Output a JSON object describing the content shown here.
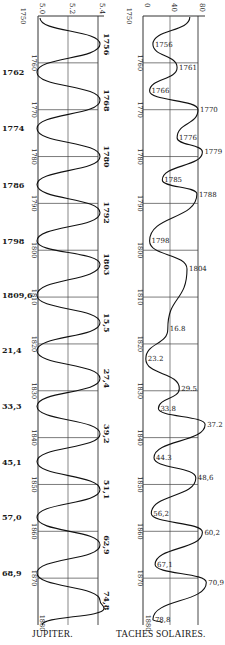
{
  "chart_data": [
    {
      "type": "line",
      "title": "JUPITER.",
      "orientation": "vertical-time",
      "xaxis": {
        "ticks": [
          "5.0",
          "5.2",
          "5.4"
        ],
        "range": [
          5.0,
          5.4
        ]
      },
      "yaxis": {
        "label": "year",
        "ticks": [
          "1750",
          "1760",
          "1770",
          "1780",
          "1790",
          "1800",
          "1810",
          "1820",
          "1830",
          "1840",
          "1850",
          "1860",
          "1870",
          "1880"
        ],
        "range": [
          1750,
          1880
        ]
      },
      "grid": true,
      "minima_labels": [
        "1762",
        "1774",
        "1786",
        "1798",
        "1809,6",
        "21,4",
        "33,3",
        "45,1",
        "57,0",
        "68,9"
      ],
      "minima_years": [
        1762,
        1774,
        1786,
        1798,
        1809.6,
        1821.4,
        1833.3,
        1845.1,
        1857.0,
        1868.9
      ],
      "maxima_labels": [
        "1756",
        "1768",
        "1780",
        "1792",
        "1803",
        "15,5",
        "27,4",
        "39,2",
        "51,1",
        "62,9",
        "74,8"
      ],
      "maxima_years": [
        1756,
        1768,
        1780,
        1792,
        1803,
        1815.5,
        1827.4,
        1839.2,
        1851.1,
        1862.9,
        1874.8
      ]
    },
    {
      "type": "line",
      "title": "TACHES SOLAIRES.",
      "orientation": "vertical-time",
      "xaxis": {
        "ticks": [
          "0",
          "40",
          "80"
        ],
        "range": [
          0,
          80
        ]
      },
      "yaxis": {
        "label": "year",
        "ticks": [
          "1750",
          "1760",
          "1770",
          "1780",
          "1790",
          "1800",
          "1810",
          "1820",
          "1830",
          "1840",
          "1850",
          "1860",
          "1870",
          "1880"
        ],
        "range": [
          1750,
          1880
        ]
      },
      "grid": true,
      "minima_labels": [
        "1756",
        "1766",
        "1776",
        "1785",
        "1798",
        "23.2",
        "33.8",
        "44.3",
        "56,2",
        "67,1",
        "78,8"
      ],
      "minima_years": [
        1756,
        1766,
        1776,
        1785,
        1798,
        1823.2,
        1833.8,
        1844.3,
        1856.2,
        1867.1,
        1878.8
      ],
      "maxima_labels": [
        "1761",
        "1770",
        "1779",
        "1788",
        "1804",
        "16.8",
        "29.5",
        "37.2",
        "48,6",
        "60,2",
        "70,9"
      ],
      "maxima_years": [
        1761,
        1770,
        1779,
        1788,
        1804,
        1816.8,
        1829.5,
        1837.2,
        1848.6,
        1860.2,
        1870.9
      ]
    }
  ],
  "captions": {
    "left": "JUPITER.",
    "right": "TACHES SOLAIRES."
  }
}
